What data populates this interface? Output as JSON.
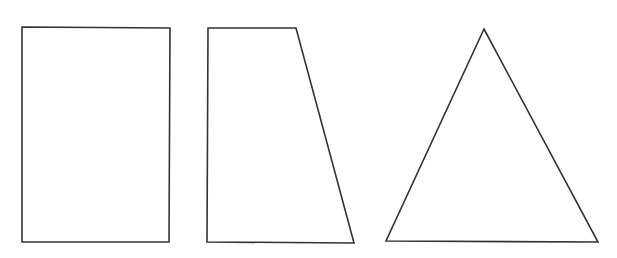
{
  "diagram": {
    "width": 617,
    "height": 258,
    "background": "#ffffff",
    "stroke_color": "#333333",
    "stroke_width": 1.6,
    "shapes": [
      {
        "name": "rectangle",
        "type": "rectangle",
        "points": "22,27 170,28 169,242 22,242"
      },
      {
        "name": "trapezoid",
        "type": "trapezoid",
        "points": "208,28 296,28 354,243 207,242"
      },
      {
        "name": "triangle",
        "type": "triangle",
        "points": "484,29 598,242 386,241"
      }
    ]
  }
}
